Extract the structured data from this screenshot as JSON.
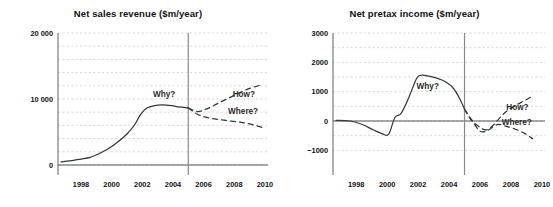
{
  "figure": {
    "background": "#ffffff",
    "line_color": "#2f3b38",
    "grid_color": "#c9c9c9",
    "axis_color": "#6f6f6f"
  },
  "chart_data": [
    {
      "type": "line",
      "panel": "left",
      "title": "Net sales revenue ($m/year)",
      "xlabel": "",
      "ylabel": "",
      "xlim": [
        1996.5,
        2010.2
      ],
      "ylim": [
        0,
        20000
      ],
      "grid": true,
      "legend": "none",
      "y_ticks": [
        0,
        10000,
        20000
      ],
      "y_tick_labels": [
        "0",
        "10 000",
        "20 000"
      ],
      "y_gridlines": [
        0,
        2000,
        4000,
        6000,
        8000,
        10000,
        12000,
        14000,
        16000,
        18000,
        20000
      ],
      "x_ticks": [
        1998,
        2000,
        2002,
        2004,
        2006,
        2008,
        2010
      ],
      "x_tick_labels": [
        "1998",
        "2000",
        "2002",
        "2004",
        "2006",
        "2008",
        "2010"
      ],
      "now_marker_year": 2005,
      "series": [
        {
          "name": "history",
          "style": "solid",
          "x": [
            1996.7,
            1997.5,
            1998.0,
            1998.6,
            1999.2,
            1999.8,
            2000.4,
            2001.0,
            2001.5,
            2001.9,
            2002.3,
            2002.8,
            2003.3,
            2003.9,
            2004.4,
            2005.0
          ],
          "values": [
            480,
            700,
            900,
            1150,
            1750,
            2500,
            3500,
            4700,
            6100,
            7700,
            8650,
            9000,
            9100,
            9000,
            8800,
            8650
          ]
        },
        {
          "name": "forecast-how",
          "style": "dashed",
          "x": [
            2005.0,
            2005.6,
            2006.2,
            2006.9,
            2007.6,
            2008.3,
            2009.0,
            2009.7
          ],
          "values": [
            8650,
            8100,
            8500,
            9300,
            10100,
            10900,
            11600,
            12100
          ]
        },
        {
          "name": "forecast-where",
          "style": "dashed",
          "x": [
            2005.0,
            2005.6,
            2006.2,
            2007.0,
            2007.8,
            2008.6,
            2009.3,
            2009.8
          ],
          "values": [
            8650,
            7700,
            7200,
            6900,
            6650,
            6400,
            6050,
            5700
          ]
        }
      ],
      "annotations": [
        {
          "text": "Why?",
          "x": 2002.7,
          "y": 10300
        },
        {
          "text": "How?",
          "x": 2007.9,
          "y": 10350
        },
        {
          "text": "Where?",
          "x": 2007.6,
          "y": 7700
        }
      ]
    },
    {
      "type": "line",
      "panel": "right",
      "title": "Net pretax income ($m/year)",
      "xlabel": "",
      "ylabel": "",
      "xlim": [
        1996.5,
        2010.2
      ],
      "ylim": [
        -1500,
        3000
      ],
      "grid": true,
      "legend": "none",
      "y_ticks": [
        -1000,
        0,
        1000,
        2000,
        3000
      ],
      "y_tick_labels": [
        "−1000",
        "0",
        "1000",
        "2000",
        "3000"
      ],
      "y_gridlines": [
        -1000,
        -500,
        0,
        500,
        1000,
        1500,
        2000,
        2500,
        3000
      ],
      "x_ticks": [
        1998,
        2000,
        2002,
        2004,
        2006,
        2008,
        2010
      ],
      "x_tick_labels": [
        "1998",
        "2000",
        "2002",
        "2004",
        "2006",
        "2008",
        "2010"
      ],
      "now_marker_year": 2005,
      "zero_axis": true,
      "series": [
        {
          "name": "history",
          "style": "solid",
          "x": [
            1996.7,
            1997.6,
            1998.4,
            1999.1,
            1999.7,
            2000.1,
            2000.5,
            2000.9,
            2001.4,
            2001.9,
            2002.2,
            2002.6,
            2003.2,
            2003.8,
            2004.3,
            2004.7,
            2005.0
          ],
          "values": [
            20,
            0,
            -120,
            -300,
            -440,
            -450,
            120,
            260,
            800,
            1450,
            1560,
            1540,
            1460,
            1330,
            1100,
            750,
            400
          ]
        },
        {
          "name": "forecast-how",
          "style": "dashed",
          "x": [
            2005.0,
            2005.4,
            2005.9,
            2006.4,
            2006.9,
            2007.4,
            2007.9,
            2008.4,
            2008.9,
            2009.3
          ],
          "values": [
            400,
            60,
            -180,
            -300,
            -120,
            180,
            400,
            560,
            700,
            820
          ]
        },
        {
          "name": "forecast-where",
          "style": "dashed",
          "x": [
            2005.0,
            2005.5,
            2006.0,
            2006.5,
            2007.1,
            2007.7,
            2008.3,
            2008.9,
            2009.4
          ],
          "values": [
            400,
            10,
            -350,
            -320,
            -120,
            -180,
            -280,
            -430,
            -600
          ]
        }
      ],
      "annotations": [
        {
          "text": "Why?",
          "x": 2001.9,
          "y": 1080
        },
        {
          "text": "How?",
          "x": 2007.7,
          "y": 380
        },
        {
          "text": "Where?",
          "x": 2007.4,
          "y": -120
        }
      ]
    }
  ]
}
